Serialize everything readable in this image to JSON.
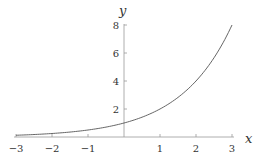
{
  "chart_data": {
    "type": "line",
    "title": "",
    "xlabel": "x",
    "ylabel": "y",
    "function": "y = 2^x",
    "xlim": [
      -3,
      3
    ],
    "ylim": [
      0,
      8
    ],
    "grid": false,
    "x_ticks": [
      "-3",
      "-2",
      "-1",
      "1",
      "2",
      "3"
    ],
    "y_ticks": [
      "2",
      "4",
      "6",
      "8"
    ],
    "series": [
      {
        "name": "2^x",
        "color": "#555555",
        "x": [
          -3,
          -2.5,
          -2,
          -1.5,
          -1,
          -0.5,
          0,
          0.5,
          1,
          1.5,
          2,
          2.5,
          3
        ],
        "y": [
          0.125,
          0.177,
          0.25,
          0.354,
          0.5,
          0.707,
          1,
          1.414,
          2,
          2.828,
          4,
          5.657,
          8
        ]
      }
    ]
  }
}
